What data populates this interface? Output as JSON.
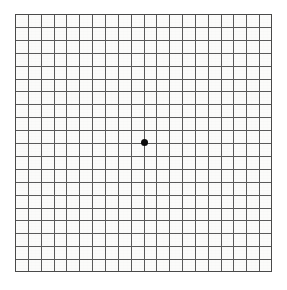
{
  "chart_data": {
    "type": "table",
    "title": "Amsler Grid",
    "subtitle": "",
    "columns": 20,
    "rows": 20,
    "cell_size_px": 12.85,
    "grid": true,
    "legend": "none",
    "xlabel": "",
    "ylabel": "",
    "x": [
      0,
      1,
      2,
      3,
      4,
      5,
      6,
      7,
      8,
      9,
      10,
      11,
      12,
      13,
      14,
      15,
      16,
      17,
      18,
      19,
      20
    ],
    "y": [
      0,
      1,
      2,
      3,
      4,
      5,
      6,
      7,
      8,
      9,
      10,
      11,
      12,
      13,
      14,
      15,
      16,
      17,
      18,
      19,
      20
    ],
    "xlim": [
      0,
      20
    ],
    "ylim": [
      0,
      20
    ],
    "annotations": [
      {
        "label": "central fixation dot",
        "x": 10,
        "y": 10,
        "shape": "filled-circle"
      }
    ]
  },
  "plate": {
    "name": "amsler-grid",
    "left_px": 15,
    "top_px": 14,
    "width_px": 257,
    "height_px": 258,
    "columns": 20,
    "rows": 20,
    "background_color": "#fbfbfa",
    "line_color": "#5a5a5a",
    "line_width_px": 1,
    "border_color": "#4a4a4a",
    "border_width_px": 1
  },
  "fixation_dot": {
    "name": "fixation-dot",
    "center_x_px": 144.5,
    "center_y_px": 142.5,
    "diameter_px": 7,
    "color": "#0b0b0b"
  },
  "page": {
    "width_px": 287,
    "height_px": 290,
    "background_color": "#ffffff"
  }
}
